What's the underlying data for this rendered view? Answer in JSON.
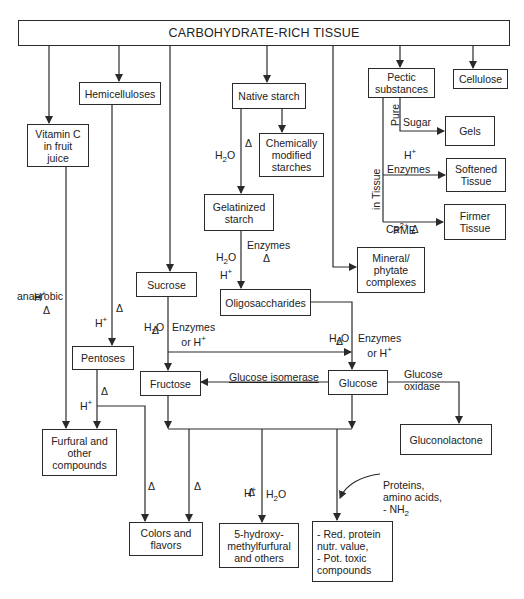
{
  "diagram": {
    "title": "CARBOHYDRATE-RICH TISSUE",
    "nodes": {
      "vitamin_c": "Vitamin C\nin fruit\njuice",
      "hemicelluloses": "Hemicelluloses",
      "native_starch": "Native starch",
      "pectic": "Pectic\nsubstances",
      "cellulose": "Cellulose",
      "gels": "Gels",
      "chem_mod": "Chemically\nmodified\nstarches",
      "gelatinized": "Gelatinized\nstarch",
      "softened": "Softened\nTissue",
      "firmer": "Firmer\nTissue",
      "sucrose": "Sucrose",
      "mineral": "Mineral/\nphytate\ncomplexes",
      "oligo": "Oligosaccharides",
      "pentoses": "Pentoses",
      "fructose": "Fructose",
      "glucose": "Glucose",
      "furfural": "Furfural and\nother\ncompounds",
      "gluconolactone": "Gluconolactone",
      "colors": "Colors and\nflavors",
      "hmf": "5-hydroxy-\nmethylfurfural\nand others",
      "protein": "- Red. protein\n  nutr. value,\n- Pot. toxic\n  compounds"
    },
    "labels": {
      "h2o": "H",
      "h2o_sub": "2",
      "h2o_o": "O",
      "delta": "Δ",
      "h_plus": "H",
      "plus": "+",
      "anaerobic": "anaerobic",
      "enzymes": "Enzymes",
      "enzymes_or": "Enzymes\nor H",
      "pure": "Pure",
      "sugar": "Sugar",
      "in_tissue": "in Tissue",
      "ca": "Ca",
      "ca_sup": "2+",
      "pme": "PME",
      "glucose_isomerase": "Glucose isomerase",
      "glucose_oxidase": "Glucose\noxidase",
      "proteins": "Proteins,\namino acids,\n- NH",
      "nh_sub": "2"
    }
  }
}
